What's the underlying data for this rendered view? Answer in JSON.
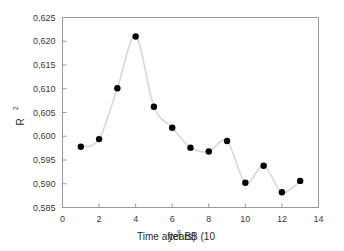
{
  "chart_data": {
    "type": "line",
    "title": "",
    "subtitle": "",
    "xlabel": "Time after BB (10",
    "xlabel_sup": "9",
    "xlabel_tail": " years)",
    "xlabel_full": "Time after BB (10^9 years)",
    "ylabel": "R",
    "ylabel_sup": "2",
    "ylabel_full": "R^2",
    "x": [
      1,
      2,
      3,
      4,
      5,
      6,
      7,
      8,
      9,
      10,
      11,
      12,
      13
    ],
    "values": [
      0.5978,
      0.5994,
      0.6101,
      0.621,
      0.6062,
      0.6018,
      0.5976,
      0.5968,
      0.599,
      0.5902,
      0.5938,
      0.5882,
      0.5906
    ],
    "series": [
      {
        "name": "R2",
        "values": [
          0.5978,
          0.5994,
          0.6101,
          0.621,
          0.6062,
          0.6018,
          0.5976,
          0.5968,
          0.599,
          0.5902,
          0.5938,
          0.5882,
          0.5906
        ]
      }
    ],
    "xlim": [
      0,
      14
    ],
    "ylim": [
      0.585,
      0.625
    ],
    "xticks": [
      0,
      2,
      4,
      6,
      8,
      10,
      12,
      14
    ],
    "xticklabels": [
      "0",
      "2",
      "4",
      "6",
      "8",
      "10",
      "12",
      "14"
    ],
    "yticks": [
      0.585,
      0.59,
      0.595,
      0.6,
      0.605,
      0.61,
      0.615,
      0.62,
      0.625
    ],
    "yticklabels": [
      "0,585",
      "0,590",
      "0,595",
      "0,600",
      "0,605",
      "0,610",
      "0,615",
      "0,620",
      "0,625"
    ],
    "decimal_separator": ",",
    "grid": false,
    "legend": null,
    "legend_position": "none",
    "smoothing": "spline",
    "marker_style": "filled-circle",
    "marker_color": "#000000",
    "line_color": "#d8d8d8",
    "axis_color": "#9a9a9a",
    "background_color": "#ffffff"
  }
}
